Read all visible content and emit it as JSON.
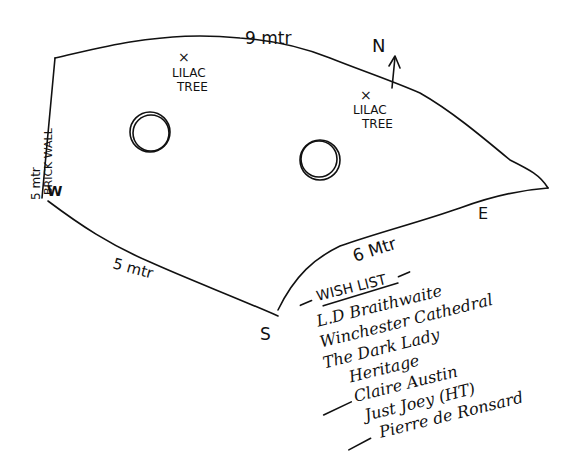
{
  "plan": {
    "kind": "garden-bed-sketch",
    "ink_color": "#111111",
    "background": "#ffffff",
    "edges": {
      "north": "9 mtr",
      "west_length": "5 mtr",
      "west_note": "BRICK WALL",
      "southwest": "5 mtr",
      "southeast": "6 Mtr"
    },
    "compass": {
      "north": "N",
      "east": "E",
      "south": "S",
      "west_mark": "W"
    },
    "trees": [
      {
        "marker": "×",
        "line1": "LILAC",
        "line2": "TREE"
      },
      {
        "marker": "×",
        "line1": "LILAC",
        "line2": "TREE"
      }
    ],
    "circles_count": 2
  },
  "wishlist": {
    "title": "WISH LIST",
    "items": [
      "L.D Braithwaite",
      "Winchester Cathedral",
      "The Dark Lady",
      "Heritage",
      "Claire Austin",
      "Just Joey (HT)",
      "Pierre de Ronsard"
    ]
  }
}
